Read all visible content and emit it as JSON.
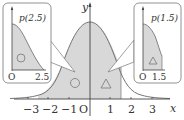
{
  "figure": {
    "type": "standard-normal-distribution-diagram",
    "axis": {
      "x_label": "x",
      "y_label": "y",
      "origin_label": "O",
      "ticks": [
        "−3",
        "−2",
        "−1",
        "1",
        "2",
        "3"
      ]
    },
    "shaded_region": {
      "from": -2.5,
      "to": 1.5
    },
    "left_inset": {
      "label": "p(2.5)",
      "x_ticks": [
        "O",
        "2.5"
      ],
      "marker": "circle"
    },
    "right_inset": {
      "label": "p(1.5)",
      "x_ticks": [
        "O",
        "1.5"
      ],
      "marker": "triangle"
    },
    "markers": {
      "left_region": "circle",
      "right_region": "triangle"
    }
  },
  "colors": {
    "shade": "#d8d8d8",
    "line": "#555555",
    "box": "#777777"
  }
}
